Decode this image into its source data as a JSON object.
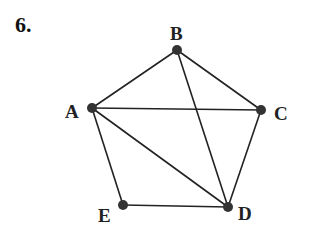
{
  "problem_number": "6.",
  "graph": {
    "nodes": [
      {
        "id": "A",
        "label": "A",
        "x": 92,
        "y": 108,
        "label_x": 65,
        "label_y": 102
      },
      {
        "id": "B",
        "label": "B",
        "x": 177,
        "y": 50,
        "label_x": 170,
        "label_y": 24
      },
      {
        "id": "C",
        "label": "C",
        "x": 261,
        "y": 110,
        "label_x": 274,
        "label_y": 104
      },
      {
        "id": "D",
        "label": "D",
        "x": 228,
        "y": 207,
        "label_x": 238,
        "label_y": 204
      },
      {
        "id": "E",
        "label": "E",
        "x": 123,
        "y": 205,
        "label_x": 98,
        "label_y": 206
      }
    ],
    "edges": [
      [
        "A",
        "B"
      ],
      [
        "B",
        "C"
      ],
      [
        "A",
        "C"
      ],
      [
        "A",
        "E"
      ],
      [
        "A",
        "D"
      ],
      [
        "B",
        "D"
      ],
      [
        "C",
        "D"
      ],
      [
        "E",
        "D"
      ]
    ],
    "node_color": "#333333",
    "edge_color": "#222222"
  }
}
